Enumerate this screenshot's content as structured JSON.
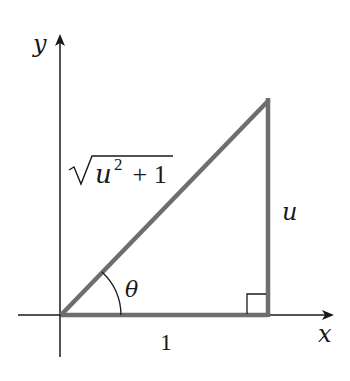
{
  "diagram": {
    "type": "right-triangle-on-axes",
    "axes": {
      "x_label": "x",
      "y_label": "y"
    },
    "triangle": {
      "vertices": [
        "origin",
        "(1, 0)",
        "(1, u)"
      ],
      "hypotenuse_label_radicand": "u",
      "hypotenuse_label_exponent": "2",
      "hypotenuse_label_rest": " + 1",
      "base_label": "1",
      "height_label": "u",
      "angle_label": "θ",
      "right_angle_marker": true
    },
    "colors": {
      "axis": "#1a1a1a",
      "triangle_stroke": "#6e6e6e",
      "text": "#1a1a1a"
    }
  }
}
